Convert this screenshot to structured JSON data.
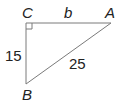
{
  "diagram": {
    "type": "right-triangle",
    "vertices": {
      "C": {
        "label": "C",
        "x": 26,
        "y": 23,
        "right_angle": true
      },
      "A": {
        "label": "A",
        "x": 111,
        "y": 23
      },
      "B": {
        "label": "B",
        "x": 26,
        "y": 84
      }
    },
    "sides": {
      "CA": {
        "label": "b"
      },
      "CB": {
        "label": "15"
      },
      "AB": {
        "label": "25"
      }
    },
    "colors": {
      "line": "#7a7a7a",
      "text": "#222222"
    }
  }
}
